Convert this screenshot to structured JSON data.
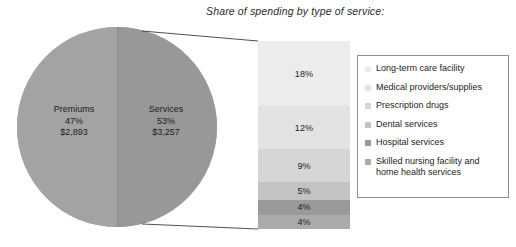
{
  "chart_data": {
    "type": "pie",
    "title": "Share of spending by type of service:",
    "xlabel": "",
    "ylabel": "",
    "legend_position": "right",
    "grid": false,
    "pie": {
      "categories": [
        "Premiums",
        "Services"
      ],
      "values": [
        47,
        53
      ],
      "amounts": [
        "$2,893",
        "$3,257"
      ],
      "slices": [
        {
          "name": "Premiums",
          "percent": "47%",
          "amount": "$2,893",
          "value": 47,
          "color": "#a3a3a3"
        },
        {
          "name": "Services",
          "percent": "53%",
          "amount": "$3,257",
          "value": 53,
          "color": "#989898"
        }
      ]
    },
    "stacked_bar": {
      "categories": [
        "Long-term care facility",
        "Medical providers/supplies",
        "Prescription drugs",
        "Dental services",
        "Hospital services",
        "Skilled nursing facility and home health services"
      ],
      "values": [
        18,
        12,
        9,
        5,
        4,
        4
      ],
      "segments": [
        {
          "label": "18%",
          "value": 18,
          "color": "#ececec"
        },
        {
          "label": "12%",
          "value": 12,
          "color": "#e3e3e3"
        },
        {
          "label": "9%",
          "value": 9,
          "color": "#d6d6d6"
        },
        {
          "label": "5%",
          "value": 5,
          "color": "#c3c3c3"
        },
        {
          "label": "4%",
          "value": 4,
          "color": "#9a9a9a"
        },
        {
          "label": "4%",
          "value": 4,
          "color": "#ababab"
        }
      ]
    }
  },
  "title": "Share of spending by type of service:",
  "pie": {
    "left": {
      "name": "Premiums",
      "percent": "47%",
      "amount": "$2,893"
    },
    "right": {
      "name": "Services",
      "percent": "53%",
      "amount": "$3,257"
    }
  },
  "bar": {
    "segments": [
      {
        "label": "18%",
        "color": "#ececec"
      },
      {
        "label": "12%",
        "color": "#e3e3e3"
      },
      {
        "label": "9%",
        "color": "#d6d6d6"
      },
      {
        "label": "5%",
        "color": "#c3c3c3"
      },
      {
        "label": "4%",
        "color": "#9a9a9a"
      },
      {
        "label": "4%",
        "color": "#ababab"
      }
    ]
  },
  "legend": {
    "items": [
      {
        "label": "Long-term care facility",
        "color": "#ececec"
      },
      {
        "label": " Medical providers/supplies",
        "color": "#e3e3e3"
      },
      {
        "label": "Prescription drugs",
        "color": "#d6d6d6"
      },
      {
        "label": "Dental services",
        "color": "#c3c3c3"
      },
      {
        "label": "Hospital services",
        "color": "#9a9a9a"
      },
      {
        "label": "Skilled nursing facility and home health services",
        "color": "#ababab"
      }
    ]
  }
}
